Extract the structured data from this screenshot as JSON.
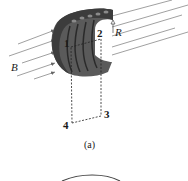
{
  "figure": {
    "caption": "(a)",
    "labels": {
      "field": "B",
      "radius": "R",
      "point1": "1",
      "point2": "2",
      "point3": "3",
      "point4": "4"
    }
  },
  "colors": {
    "coil": "#555555",
    "coil_dark": "#333333",
    "field_lines": "#777777",
    "dashed": "#222222"
  }
}
